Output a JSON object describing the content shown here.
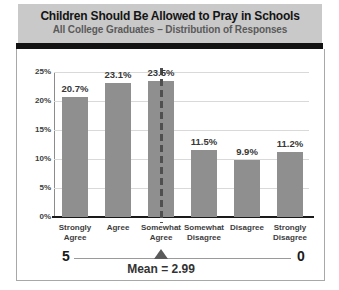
{
  "header": {
    "title": "Children Should Be Allowed to Pray in Schools",
    "subtitle": "All College Graduates – Distribution of Responses"
  },
  "chart_data": {
    "type": "bar",
    "title": "Children Should Be Allowed to Pray in Schools",
    "subtitle": "All College Graduates – Distribution of Responses",
    "categories": [
      "Strongly Agree",
      "Agree",
      "Somewhat Agree",
      "Somewhat Disagree",
      "Disagree",
      "Strongly Disagree"
    ],
    "values": [
      20.7,
      23.1,
      23.5,
      11.5,
      9.9,
      11.2
    ],
    "value_labels": [
      "20.7%",
      "23.1%",
      "23.5%",
      "11.5%",
      "9.9%",
      "11.2%"
    ],
    "xlabel": "",
    "ylabel": "",
    "ylim": [
      0,
      25
    ],
    "yticks": [
      {
        "label": "25%",
        "value": 25
      },
      {
        "label": "20%",
        "value": 20
      },
      {
        "label": "15%",
        "value": 15
      },
      {
        "label": "10%",
        "value": 10
      },
      {
        "label": "5%",
        "value": 5
      },
      {
        "label": "0%",
        "value": 0
      }
    ],
    "grid": true,
    "legend": null,
    "mean": {
      "value": 2.99,
      "label": "Mean = 2.99",
      "marker_category_index": 2
    },
    "scale": {
      "left_label": "5",
      "right_label": "0"
    },
    "colors": {
      "bar": "#8f8f8f",
      "title_band": "#c9c9c9",
      "dashed_line": "#4f4f4f",
      "gridline": "#d9d9d9",
      "axis": "#1a1a1a"
    }
  }
}
